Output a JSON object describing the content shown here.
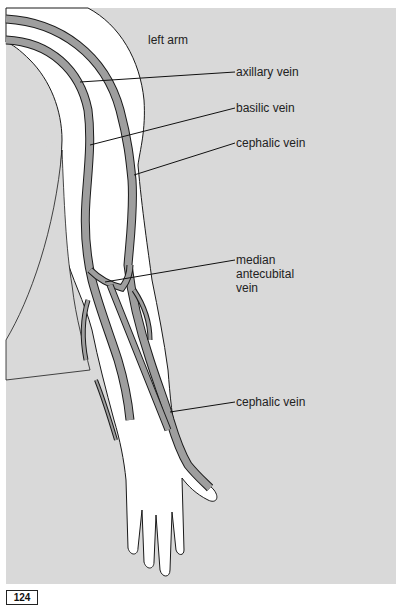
{
  "figure": {
    "title": "left arm",
    "page_number": "124",
    "colors": {
      "background": "#d9d9d9",
      "skin": "#ffffff",
      "vein": "#9e9e9e",
      "outline": "#1a1a1a"
    }
  },
  "labels": [
    {
      "id": "axillary",
      "text": "axillary vein"
    },
    {
      "id": "basilic",
      "text": "basilic vein"
    },
    {
      "id": "cephalic_upper",
      "text": "cephalic vein"
    },
    {
      "id": "median_antecubital",
      "lines": [
        "median",
        "antecubital",
        "vein"
      ]
    },
    {
      "id": "cephalic_lower",
      "text": "cephalic vein"
    }
  ]
}
